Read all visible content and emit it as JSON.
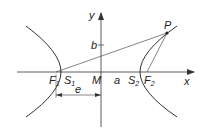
{
  "diagram": {
    "colors": {
      "stroke": "#333333",
      "background": "#ffffff"
    },
    "axes": {
      "x_label": "x",
      "y_label": "y"
    },
    "labels": {
      "origin": "M",
      "semi_major": "a",
      "semi_minor": "b",
      "eccentricity_distance": "e",
      "point": "P",
      "focus_left": "F",
      "focus_left_sub": "1",
      "focus_right": "F",
      "focus_right_sub": "2",
      "vertex_left": "S",
      "vertex_left_sub": "1",
      "vertex_right": "S",
      "vertex_right_sub": "2"
    }
  }
}
